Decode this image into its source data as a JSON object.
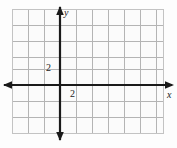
{
  "figure": {
    "kind": "coordinate-plane",
    "colors": {
      "background": "#fdfdfd",
      "grid_line": "#b4b4b4",
      "axis_line": "#1a1a1a",
      "border": "#c9c9c9",
      "label_text": "#1a1a1a"
    },
    "grid": {
      "left": 12,
      "top": 9,
      "right": 164,
      "bottom": 134,
      "cell_size": 16,
      "columns": 9,
      "rows": 8,
      "show_border": true
    },
    "axes": {
      "origin_x": 60,
      "origin_y": 85,
      "x_axis": {
        "label": "x",
        "label_left": 167,
        "label_top": 90,
        "start": 4,
        "end": 172,
        "arrow_left": true,
        "arrow_right": true,
        "stroke_width": 2.2
      },
      "y_axis": {
        "label": "y",
        "label_left": 64,
        "label_top": 8,
        "start": 7,
        "end": 140,
        "arrow_up": true,
        "arrow_down": true,
        "stroke_width": 2.2
      }
    },
    "tick_labels": [
      {
        "name": "y-axis-tick-2",
        "text": "2",
        "axis": "y",
        "value": 2,
        "left": 46,
        "top": 63
      },
      {
        "name": "x-axis-tick-2",
        "text": "2",
        "axis": "x",
        "value": 2,
        "left": 70,
        "top": 89
      }
    ]
  }
}
